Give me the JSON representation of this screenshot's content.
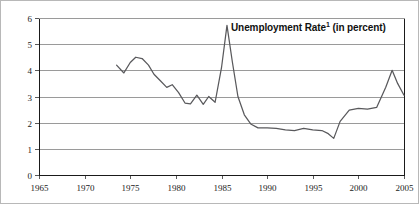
{
  "chart_data": {
    "type": "line",
    "title": "Unemployment Rate",
    "title_footnote_marker": "1",
    "title_suffix": " (in percent)",
    "xlabel": "",
    "ylabel": "",
    "xlim": [
      1965,
      2005
    ],
    "ylim": [
      0,
      6
    ],
    "xticks": [
      1965,
      1970,
      1975,
      1980,
      1985,
      1990,
      1995,
      2000,
      2005
    ],
    "yticks": [
      0,
      1,
      2,
      3,
      4,
      5,
      6
    ],
    "xtick_labels": [
      "1965",
      "1970",
      "1975",
      "1980",
      "1985",
      "1990",
      "1995",
      "2000",
      "2005"
    ],
    "ytick_labels": [
      "0",
      "1",
      "2",
      "3",
      "4",
      "5",
      "6"
    ],
    "grid": true,
    "grid_axis": "y",
    "legend": false,
    "line_color": "#59595c",
    "grid_color": "#9a9a9a",
    "axis_color": "#1a1a1a",
    "series": [
      {
        "name": "Unemployment Rate",
        "x": [
          1973.5,
          1974.3,
          1975.0,
          1975.6,
          1976.3,
          1977.0,
          1977.6,
          1978.3,
          1979.0,
          1979.6,
          1980.3,
          1981.0,
          1981.6,
          1982.3,
          1983.0,
          1983.6,
          1984.3,
          1985.0,
          1985.6,
          1986.2,
          1986.8,
          1987.5,
          1988.2,
          1989.0,
          1990.0,
          1991.0,
          1992.0,
          1993.0,
          1994.0,
          1995.0,
          1996.0,
          1996.7,
          1997.3,
          1998.0,
          1999.0,
          2000.0,
          2001.0,
          2002.0,
          2003.0,
          2003.7,
          2004.3,
          2005.0
        ],
        "y": [
          4.2,
          3.9,
          4.3,
          4.5,
          4.45,
          4.2,
          3.85,
          3.6,
          3.35,
          3.45,
          3.15,
          2.75,
          2.72,
          3.05,
          2.7,
          3.0,
          2.78,
          4.1,
          5.72,
          4.3,
          3.0,
          2.3,
          1.95,
          1.8,
          1.8,
          1.78,
          1.72,
          1.7,
          1.78,
          1.72,
          1.7,
          1.58,
          1.4,
          2.05,
          2.48,
          2.55,
          2.52,
          2.58,
          3.35,
          4.0,
          3.5,
          3.05
        ]
      }
    ],
    "annotations": [
      {
        "text": "Unemployment Rate",
        "footnote": "1",
        "suffix": " (in percent)",
        "position": "top-right-inside"
      }
    ]
  }
}
